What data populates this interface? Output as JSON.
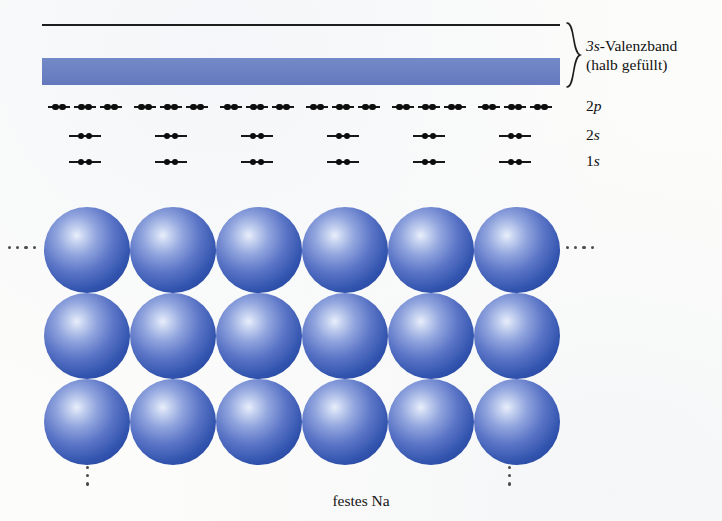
{
  "figure": {
    "caption": "festes Na",
    "colors": {
      "band_fill": "#6c82c3",
      "sphere_core": "#e9eefb",
      "sphere_edge": "#21409a",
      "line": "#1d1d1d",
      "electron": "#0d0d0d",
      "page_background": "#fcfcfa"
    },
    "band": {
      "brace_icon": "curly-brace-right",
      "label_line_1_prefix": "3s",
      "label_line_1_rest": "-Valenzband",
      "label_line_2": "(halb gefüllt)"
    },
    "levels": [
      {
        "id": "2p",
        "label_prefix": "2",
        "label_orbital": "p",
        "atoms": 6,
        "orbitals_per_atom": 3
      },
      {
        "id": "2s",
        "label_prefix": "2",
        "label_orbital": "s",
        "atoms": 6,
        "orbitals_per_atom": 1
      },
      {
        "id": "1s",
        "label_prefix": "1",
        "label_orbital": "s",
        "atoms": 6,
        "orbitals_per_atom": 1
      }
    ],
    "lattice": {
      "columns": 6,
      "rows": 3,
      "atom_count": 18,
      "element": "Na"
    },
    "ellipses": {
      "left": "horizontal-ellipsis",
      "right": "horizontal-ellipsis",
      "bottom_left": "vertical-ellipsis",
      "bottom_right": "vertical-ellipsis",
      "dots_horizontal": 4,
      "dots_vertical": 3
    }
  }
}
